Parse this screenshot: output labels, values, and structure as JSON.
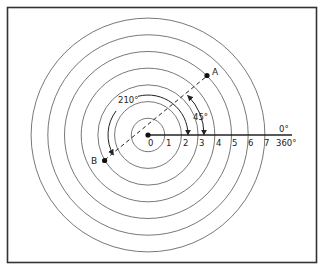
{
  "diagram": {
    "center_label": "0",
    "ring_labels": [
      "1",
      "2",
      "3",
      "4",
      "5",
      "6",
      "7"
    ],
    "axis_label_top": "0°",
    "axis_label_bottom": "360°",
    "points": [
      {
        "label": "A",
        "ring": 5,
        "angle_deg": 45
      },
      {
        "label": "B",
        "ring": 3,
        "angle_deg": 210
      }
    ],
    "angle_annotations": [
      {
        "label": "45°",
        "angle_deg": 45
      },
      {
        "label": "210°",
        "angle_deg": 210
      }
    ],
    "colors": {
      "line": "#222222",
      "ring": "#555555",
      "frame": "#333333",
      "background": "#ffffff"
    }
  }
}
